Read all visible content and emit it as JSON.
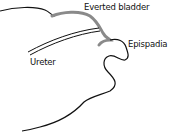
{
  "diagram": {
    "labels": {
      "everted_bladder": "Everted bladder",
      "epispadia": "Epispadia",
      "ureter": "Ureter"
    },
    "colors": {
      "outline": "#111111",
      "bladder": "#8a8a8a",
      "background": "#ffffff"
    }
  }
}
